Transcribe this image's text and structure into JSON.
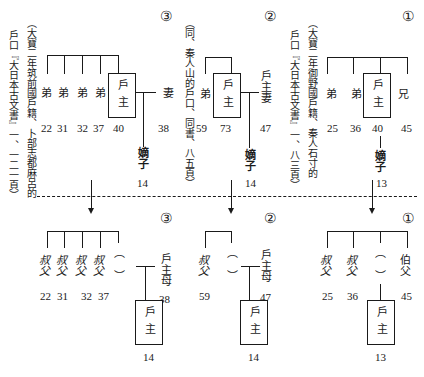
{
  "top": {
    "group3": {
      "marker": "③",
      "source_line1": "戶口『大日本古文書』一、一二一頁）",
      "source_line2": "（大寶二年筑前國戶籍、卜部志都麻呂的",
      "siblings": [
        {
          "label": "弟",
          "age": "22"
        },
        {
          "label": "弟",
          "age": "31"
        },
        {
          "label": "弟",
          "age": "32"
        },
        {
          "label": "弟",
          "age": "37"
        }
      ],
      "head": {
        "label": "戶主",
        "age": "40"
      },
      "spouse": {
        "label": "妻",
        "age": "38"
      },
      "heir": {
        "label": "嫡子",
        "age": "14"
      }
    },
    "group2": {
      "marker": "②",
      "source_line": "（同、秦人山的戶口、同書、八五頁）",
      "siblings": [
        {
          "label": "弟",
          "age": "59"
        }
      ],
      "head": {
        "label": "戶主",
        "age": "73"
      },
      "spouse": {
        "label": "戶主妻",
        "age": "47"
      },
      "heir": {
        "label": "嫡子",
        "age": "14"
      }
    },
    "group1": {
      "marker": "①",
      "source_line1": "戶口『大日本古文書』一、八三頁）",
      "source_line2": "（大寶二年御野國戶籍、秦人石寸的",
      "siblings": [
        {
          "label": "弟",
          "age": "25"
        },
        {
          "label": "弟",
          "age": "36"
        },
        {
          "label": "兄",
          "age": "45"
        }
      ],
      "head": {
        "label": "戶主",
        "age": "40"
      },
      "heir": {
        "label": "嫡子",
        "age": "13"
      }
    }
  },
  "bottom": {
    "group3": {
      "marker": "③",
      "relatives": [
        {
          "label": "叔父",
          "age": "22"
        },
        {
          "label": "叔父",
          "age": "31"
        },
        {
          "label": "叔父",
          "age": "32"
        },
        {
          "label": "叔父",
          "age": "37"
        }
      ],
      "deceased_parent": "（　）",
      "mother": {
        "label": "戶主母",
        "age": "38"
      },
      "head": {
        "label": "戶主",
        "age": "14"
      }
    },
    "group2": {
      "marker": "②",
      "relatives": [
        {
          "label": "叔父",
          "age": "59"
        }
      ],
      "deceased_parent": "（　）",
      "mother": {
        "label": "戶主母",
        "age": "47"
      },
      "head": {
        "label": "戶主",
        "age": "14"
      }
    },
    "group1": {
      "marker": "①",
      "relatives": [
        {
          "label": "叔父",
          "age": "25"
        },
        {
          "label": "叔父",
          "age": "36"
        },
        {
          "label": "伯父",
          "age": "45"
        }
      ],
      "deceased_parent": "（　）",
      "head": {
        "label": "戶主",
        "age": "13"
      }
    }
  },
  "paren_open": "︵",
  "paren_close": "︶"
}
